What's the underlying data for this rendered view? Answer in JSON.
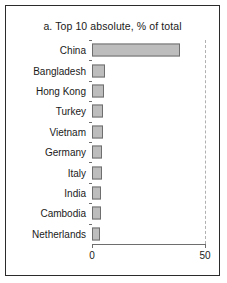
{
  "chart_data": {
    "type": "bar",
    "orientation": "horizontal",
    "title": "a. Top 10 absolute, % of total",
    "xlabel": "",
    "ylabel": "",
    "xlim": [
      0,
      50
    ],
    "xticks": [
      0,
      50
    ],
    "xtick_labels": [
      "0",
      "50"
    ],
    "grid": "dashed vertical gridline at x = 50",
    "legend": "none",
    "bar_fill_color": "#bdbdbd",
    "bar_edge_color": "#6e6e6e",
    "categories": [
      "China",
      "Bangladesh",
      "Hong Kong",
      "Turkey",
      "Vietnam",
      "Germany",
      "Italy",
      "India",
      "Cambodia",
      "Netherlands"
    ],
    "values": [
      39.0,
      5.8,
      5.4,
      5.0,
      4.8,
      4.6,
      4.4,
      4.2,
      3.8,
      3.5
    ]
  }
}
